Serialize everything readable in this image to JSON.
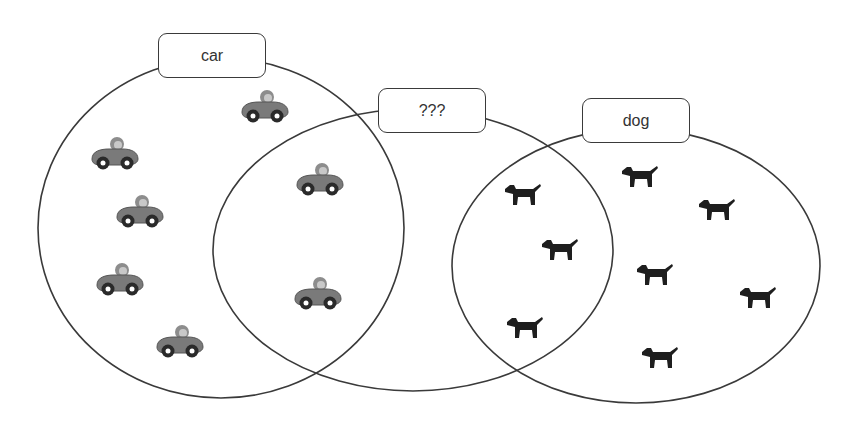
{
  "diagram": {
    "type": "venn",
    "sets": [
      {
        "id": "car",
        "label": "car",
        "ellipse": {
          "cx": 221,
          "cy": 228,
          "rx": 183,
          "ry": 170
        },
        "label_box": {
          "x": 158,
          "y": 33
        }
      },
      {
        "id": "unknown",
        "label": "???",
        "ellipse": {
          "cx": 413,
          "cy": 250,
          "rx": 200,
          "ry": 141
        },
        "label_box": {
          "x": 378,
          "y": 88
        }
      },
      {
        "id": "dog",
        "label": "dog",
        "ellipse": {
          "cx": 636,
          "cy": 266,
          "rx": 184,
          "ry": 137
        },
        "label_box": {
          "x": 582,
          "y": 98
        }
      }
    ],
    "items": {
      "cars": [
        {
          "x": 265,
          "y": 110,
          "region": "car"
        },
        {
          "x": 115,
          "y": 157,
          "region": "car"
        },
        {
          "x": 140,
          "y": 215,
          "region": "car"
        },
        {
          "x": 120,
          "y": 283,
          "region": "car"
        },
        {
          "x": 180,
          "y": 345,
          "region": "car"
        },
        {
          "x": 320,
          "y": 183,
          "region": "car ∩ ???"
        },
        {
          "x": 318,
          "y": 297,
          "region": "car ∩ ???"
        }
      ],
      "dogs": [
        {
          "x": 523,
          "y": 195,
          "region": "??? ∩ dog"
        },
        {
          "x": 560,
          "y": 250,
          "region": "??? ∩ dog"
        },
        {
          "x": 525,
          "y": 328,
          "region": "??? ∩ dog"
        },
        {
          "x": 640,
          "y": 177,
          "region": "dog"
        },
        {
          "x": 717,
          "y": 210,
          "region": "dog"
        },
        {
          "x": 655,
          "y": 275,
          "region": "dog"
        },
        {
          "x": 758,
          "y": 298,
          "region": "dog"
        },
        {
          "x": 660,
          "y": 358,
          "region": "dog"
        }
      ]
    },
    "icons": {
      "car": "car-icon",
      "dog": "dog-icon"
    },
    "colors": {
      "stroke": "#3a3a3a",
      "car_body": "#7a7a7a",
      "dog": "#1e1e1e",
      "background": "#ffffff"
    }
  }
}
